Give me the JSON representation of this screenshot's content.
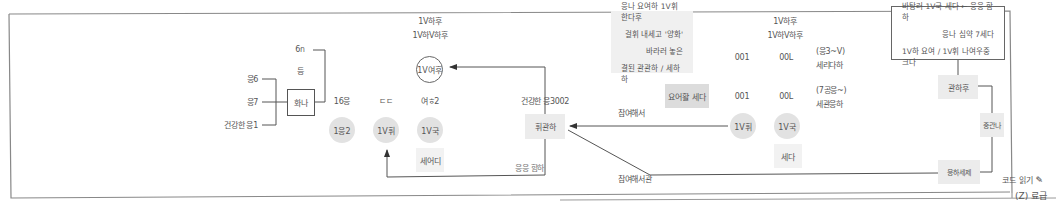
{
  "diagram": {
    "left_inputs": [
      "응6",
      "응7",
      "건강한 응1"
    ],
    "left_top_label": "6ก",
    "left_mid_label": "등",
    "left_box": "화나",
    "columns": {
      "c1": {
        "top": "16응",
        "node": "1응2"
      },
      "c2": {
        "top": "ㄷㄷ",
        "node": "1V휘"
      },
      "c3": {
        "top": "여ㅎ2",
        "node": "1V국",
        "box": "세어디"
      }
    },
    "ring_node": {
      "label": "1V여후",
      "top_lines": [
        "1V하후",
        "1V하V하후"
      ]
    },
    "center_box": {
      "label": "휘관하",
      "top": "건강한 응3002",
      "bottom": "응응 함하"
    },
    "note_box": {
      "lines": [
        "응나 요여하 1V휘 한다후",
        "걸휘 내세고 '양화'",
        "바라러 놓은",
        "결된 관관하 / 세하하"
      ]
    },
    "small_box": "요어활 세다",
    "edge_labels": {
      "upper": "참여해서",
      "lower": "참여해서관"
    },
    "right_cols": {
      "top_lines": [
        "1V하후",
        "1V하V하후"
      ],
      "row1": {
        "a": "001",
        "b": "00L",
        "c1": "(응3~V)",
        "c2": "세리다하"
      },
      "row2": {
        "a": "001",
        "b": "00L",
        "c1": "(7공응~)",
        "c2": "세관응하"
      },
      "nodes": [
        "1V휘",
        "1V국"
      ],
      "box": "세다"
    },
    "legend": {
      "lines": [
        "바탕러 1V국 세다 ← 응응 함하",
        "응나 심약 7세다",
        "1V하 요여 / 1V휘 나여우중 크다"
      ]
    },
    "chain": [
      "관하후",
      "중관나",
      "응하세제"
    ],
    "footer": {
      "edit_label": "코드 읽기",
      "caption": "(Z) 료급"
    }
  },
  "colors": {
    "line": "#555555",
    "node_fill": "#e2e2e2",
    "box_fill": "#ececec",
    "frame": "#888888"
  }
}
